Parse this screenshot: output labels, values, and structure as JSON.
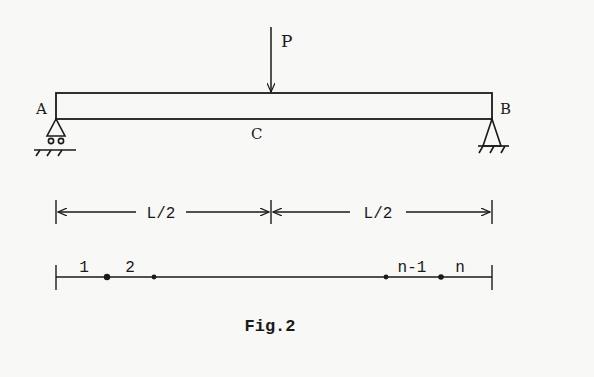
{
  "diagram": {
    "type": "simply-supported beam with central point load",
    "load": {
      "label": "P"
    },
    "supports": {
      "left": "A",
      "right": "B"
    },
    "midpoint": "C",
    "dimensions": {
      "left_span": "L/2",
      "right_span": "L/2"
    },
    "nodes": {
      "first": "1",
      "second": "2",
      "penultimate": "n-1",
      "last": "n"
    },
    "caption": "Fig.2"
  },
  "colors": {
    "ink": "#1a1a1a",
    "background": "#f8f8f6"
  }
}
